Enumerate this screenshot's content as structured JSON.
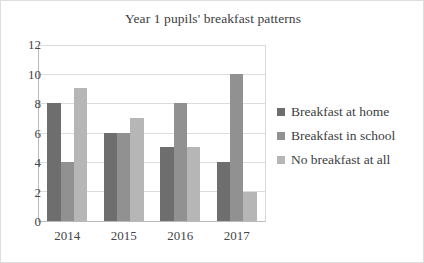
{
  "chart_data": {
    "type": "bar",
    "title": "Year 1 pupils' breakfast patterns",
    "xlabel": "",
    "ylabel": "",
    "categories": [
      "2014",
      "2015",
      "2016",
      "2017"
    ],
    "series": [
      {
        "name": "Breakfast at home",
        "values": [
          8,
          6,
          5,
          4
        ],
        "color": "#6e6e6e"
      },
      {
        "name": "Breakfast in school",
        "values": [
          4,
          6,
          8,
          10
        ],
        "color": "#919191"
      },
      {
        "name": "No breakfast at all",
        "values": [
          9,
          7,
          5,
          2
        ],
        "color": "#b6b6b6"
      }
    ],
    "ylim": [
      0,
      12
    ],
    "yticks": [
      0,
      2,
      4,
      6,
      8,
      10,
      12
    ],
    "ytick_labels": [
      "0",
      "2",
      "4",
      "6",
      "8",
      "10",
      "12"
    ],
    "grid": true,
    "legend_position": "right"
  },
  "legend": {
    "entries": [
      {
        "label": "Breakfast at home"
      },
      {
        "label": "Breakfast in school"
      },
      {
        "label": "No breakfast at all"
      }
    ]
  }
}
